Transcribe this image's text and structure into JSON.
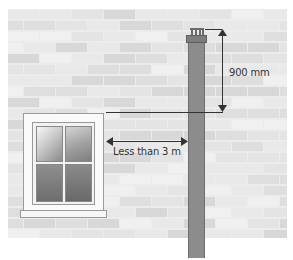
{
  "diagram": {
    "type": "flue terminal clearance illustration",
    "labels": {
      "vertical_dimension": "900 mm",
      "horizontal_dimension": "Less than 3 m"
    },
    "elements": [
      "brick-wall",
      "window",
      "flue-pipe",
      "flue-cap",
      "dimension-arrows"
    ]
  },
  "colors": {
    "wall_background": "#ececec",
    "brick_light": "#e4e4e4",
    "brick_mid": "#d8d8d8",
    "pipe": "#8c8c8c",
    "glass_top": "#f2f2f2",
    "glass_bottom": "#6e6e6e",
    "line": "#333333"
  }
}
